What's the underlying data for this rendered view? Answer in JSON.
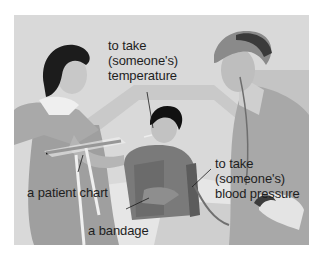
{
  "illustration": {
    "description": "Nurse and doctor attending a patient in a hospital bed",
    "background_color": "#d8d8d8"
  },
  "labels": {
    "temperature": {
      "line1": "to take",
      "line2": "(someone's)",
      "line3": "temperature"
    },
    "blood_pressure": {
      "line1": "to take",
      "line2": "(someone's)",
      "line3": "blood pressure"
    },
    "patient_chart": "a patient chart",
    "bandage": "a bandage"
  }
}
